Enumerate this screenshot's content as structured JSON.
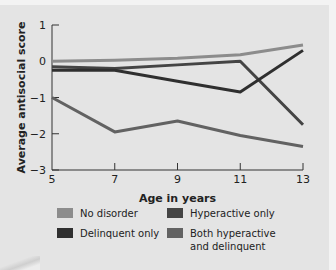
{
  "chart_data": {
    "type": "line",
    "title": "",
    "xlabel": "Age in years",
    "ylabel": "Average antisocial score",
    "x": [
      5,
      7,
      9,
      11,
      13
    ],
    "x_ticks": [
      "5",
      "7",
      "9",
      "11",
      "13"
    ],
    "y_ticks": [
      "1",
      "0",
      "−1",
      "−2",
      "−3"
    ],
    "xlim": [
      5,
      13
    ],
    "ylim": [
      -3,
      1
    ],
    "grid": false,
    "legend_position": "bottom",
    "series": [
      {
        "name": "No disorder",
        "color": "#8c8c8c",
        "values": [
          0.0,
          0.03,
          0.08,
          0.18,
          0.45
        ]
      },
      {
        "name": "Hyperactive only",
        "color": "#444444",
        "values": [
          -0.15,
          -0.2,
          -0.1,
          0.0,
          -1.75
        ]
      },
      {
        "name": "Delinquent only",
        "color": "#2f2f2f",
        "values": [
          -0.25,
          -0.25,
          -0.55,
          -0.85,
          0.3
        ]
      },
      {
        "name": "Both hyperactive and delinquent",
        "color": "#626262",
        "values": [
          -1.0,
          -1.95,
          -1.65,
          -2.05,
          -2.35
        ]
      }
    ]
  },
  "legend": {
    "items": [
      {
        "label_lines": [
          "No disorder"
        ],
        "color": "#8c8c8c"
      },
      {
        "label_lines": [
          "Hyperactive only"
        ],
        "color": "#444444"
      },
      {
        "label_lines": [
          "Delinquent only"
        ],
        "color": "#2f2f2f"
      },
      {
        "label_lines": [
          "Both hyperactive",
          "and delinquent"
        ],
        "color": "#626262"
      }
    ]
  }
}
